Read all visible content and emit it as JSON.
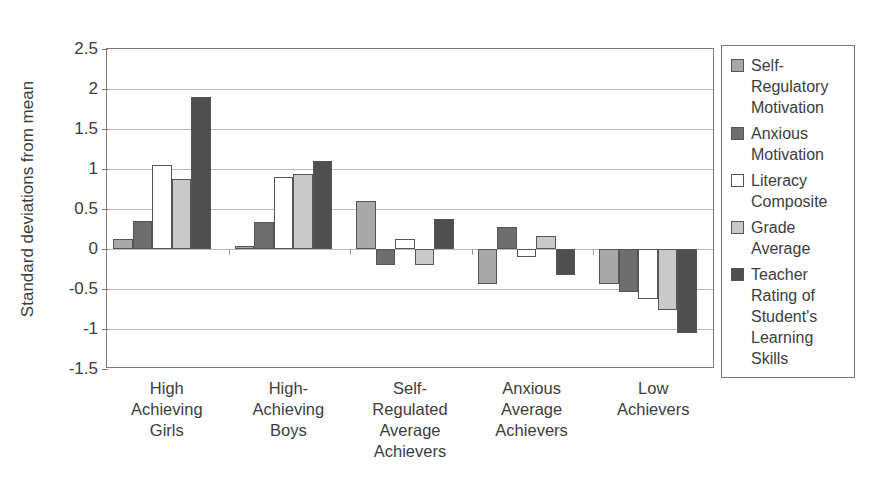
{
  "chart_data": {
    "type": "bar",
    "title": "",
    "xlabel": "",
    "ylabel": "Standard deviations from mean",
    "ylim": [
      -1.5,
      2.5
    ],
    "yticks": [
      2.5,
      2,
      1.5,
      1,
      0.5,
      0,
      -0.5,
      -1,
      -1.5
    ],
    "ytick_labels": [
      "2.5",
      "2",
      "1.5",
      "1",
      "0.5",
      "0",
      "-0.5",
      "-1",
      "-1.5"
    ],
    "grid": true,
    "legend_position": "right",
    "categories": [
      "High Achieving Girls",
      "High-Achieving Boys",
      "Self-Regulated Average Achievers",
      "Anxious Average Achievers",
      "Low Achievers"
    ],
    "category_lines": [
      [
        "High",
        "Achieving",
        "Girls"
      ],
      [
        "High-",
        "Achieving",
        "Boys"
      ],
      [
        "Self-",
        "Regulated",
        "Average",
        "Achievers"
      ],
      [
        "Anxious",
        "Average",
        "Achievers"
      ],
      [
        "Low",
        "Achievers"
      ]
    ],
    "series": [
      {
        "name": "Self-Regulatory Motivation",
        "name_lines": [
          "Self-",
          "Regulatory",
          "Motivation"
        ],
        "color": "#a8a8a8",
        "values": [
          0.13,
          0.04,
          0.6,
          -0.44,
          -0.44
        ]
      },
      {
        "name": "Anxious Motivation",
        "name_lines": [
          "Anxious",
          "Motivation"
        ],
        "color": "#6e6e6e",
        "values": [
          0.35,
          0.34,
          -0.2,
          0.28,
          -0.54
        ]
      },
      {
        "name": "Literacy Composite",
        "name_lines": [
          "Literacy",
          "Composite"
        ],
        "color": "#ffffff",
        "values": [
          1.05,
          0.9,
          0.12,
          -0.1,
          -0.62
        ]
      },
      {
        "name": "Grade Average",
        "name_lines": [
          "Grade",
          "Average"
        ],
        "color": "#c9c9c9",
        "values": [
          0.87,
          0.94,
          -0.2,
          0.16,
          -0.76
        ]
      },
      {
        "name": "Teacher Rating of Student's Learning Skills",
        "name_lines": [
          "Teacher",
          "Rating of",
          "Student's",
          "Learning",
          "Skills"
        ],
        "color": "#4f4f4f",
        "values": [
          1.9,
          1.1,
          0.38,
          -0.32,
          -1.05
        ]
      }
    ]
  }
}
